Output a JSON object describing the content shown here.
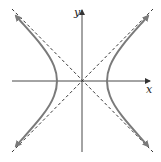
{
  "diagram": {
    "type": "hyperbola",
    "axes": {
      "x_label": "x",
      "y_label": "y"
    },
    "colors": {
      "axis": "#333333",
      "curve": "#7a7a7a",
      "asymptote": "#222222",
      "background": "#ffffff"
    },
    "curve": {
      "branches": 2,
      "orientation": "horizontal",
      "vertex_offset_px": 26
    },
    "asymptotes": {
      "count": 2,
      "style": "dashed"
    }
  }
}
